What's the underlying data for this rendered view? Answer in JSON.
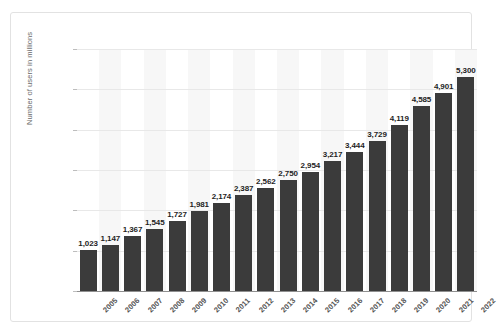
{
  "chart_data": {
    "type": "bar",
    "title": "",
    "xlabel": "",
    "ylabel": "Number of users in millions",
    "ylim": [
      0,
      6000
    ],
    "ytick_labels": [
      "0",
      "1,000",
      "2,000",
      "3,000",
      "4,000",
      "5,000",
      "6,000"
    ],
    "ytick_values": [
      0,
      1000,
      2000,
      3000,
      4000,
      5000,
      6000
    ],
    "grid": true,
    "legend": "none",
    "bar_color": "#3b3b3b",
    "categories": [
      "2005",
      "2006",
      "2007",
      "2008",
      "2009",
      "2010",
      "2011",
      "2012",
      "2013",
      "2014",
      "2015",
      "2016",
      "2017",
      "2018",
      "2019",
      "2020",
      "2021",
      "2022"
    ],
    "values": [
      1023,
      1147,
      1367,
      1545,
      1727,
      1981,
      2174,
      2387,
      2562,
      2750,
      2954,
      3217,
      3444,
      3729,
      4119,
      4585,
      4901,
      5300
    ],
    "data_labels": [
      "1,023",
      "1,147",
      "1,367",
      "1,545",
      "1,727",
      "1,981",
      "2,174",
      "2,387",
      "2,562",
      "2,750",
      "2,954",
      "3,217",
      "3,444",
      "3,729",
      "4,119",
      "4,585",
      "4,901",
      "5,300"
    ]
  }
}
